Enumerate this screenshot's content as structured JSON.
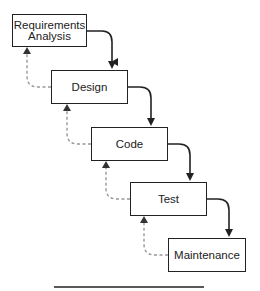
{
  "diagram": {
    "type": "waterfall-model",
    "phases": [
      {
        "id": "requirements",
        "lines": [
          "Requirements",
          "Analysis"
        ],
        "x": 12,
        "y": 14,
        "w": 75,
        "h": 33
      },
      {
        "id": "design",
        "lines": [
          "Design"
        ],
        "x": 51,
        "y": 70,
        "w": 77,
        "h": 34
      },
      {
        "id": "code",
        "lines": [
          "Code"
        ],
        "x": 91,
        "y": 127,
        "w": 77,
        "h": 34
      },
      {
        "id": "test",
        "lines": [
          "Test"
        ],
        "x": 130,
        "y": 182,
        "w": 77,
        "h": 34
      },
      {
        "id": "maintenance",
        "lines": [
          "Maintenance"
        ],
        "x": 168,
        "y": 238,
        "w": 78,
        "h": 34
      }
    ],
    "forward_arrows": {
      "style": "solid",
      "color": "#222222"
    },
    "feedback_arrows": {
      "style": "dashed",
      "color": "#999999"
    },
    "bottom_rule": {
      "x1": 54,
      "x2": 204,
      "y": 287,
      "color": "#222222"
    }
  }
}
